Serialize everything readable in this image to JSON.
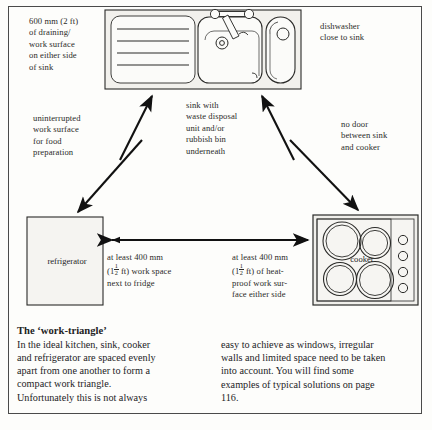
{
  "figure": {
    "sink_unit": {
      "name": "sink-unit-diagram",
      "parts": [
        "draining-board",
        "sink-basin",
        "mixer-tap",
        "plug-hole",
        "dishwasher-drawer"
      ]
    },
    "refrigerator_box_label": "refrigerator",
    "cooker_box_label": "cooker"
  },
  "callouts": {
    "draining": "600 mm (2 ft)\nof draining/\nwork surface\non either side\nof sink",
    "draining_lines": [
      "600 mm (2 ft)",
      "of draining/",
      "work surface",
      "on either side",
      "of sink"
    ],
    "dishwasher_lines": [
      "dishwasher",
      "close to sink"
    ],
    "worksurface_lines": [
      "uninterrupted",
      "work surface",
      "for food",
      "preparation"
    ],
    "sink_waste_lines": [
      "sink with",
      "waste disposal",
      "unit and/or",
      "rubbish bin",
      "underneath"
    ],
    "no_door_lines": [
      "no door",
      "between sink",
      "and cooker"
    ],
    "fridge_space_lines_1": "at least 400 mm",
    "fridge_space_lines_2_pre": "(1",
    "fridge_space_frac_num": "1",
    "fridge_space_frac_den": "2",
    "fridge_space_lines_2_post": " ft) work space",
    "fridge_space_lines_3": "next to fridge",
    "cooker_space_lines_1": "at least 400 mm",
    "cooker_space_lines_2_pre": "(1",
    "cooker_space_frac_num": "1",
    "cooker_space_frac_den": "2",
    "cooker_space_lines_2_post": " ft) of heat-",
    "cooker_space_lines_3": "proof work sur-",
    "cooker_space_lines_4": "face either side"
  },
  "article": {
    "heading": "The ‘work-triangle’",
    "left_col": [
      "In the ideal kitchen, sink, cooker",
      "and refrigerator are spaced evenly",
      "apart from one another to form a",
      "compact work triangle.",
      "Unfortunately this is not always"
    ],
    "right_col": [
      "easy to achieve as windows, irregular",
      "walls and limited space need to be taken",
      "into account.  You will find some",
      "examples of typical solutions on page",
      "116."
    ]
  },
  "colors": {
    "ink": "#2a2a28",
    "frame": "#4a4a4a",
    "fill": "#f2f1ed",
    "paper": "#fdfdfb"
  }
}
